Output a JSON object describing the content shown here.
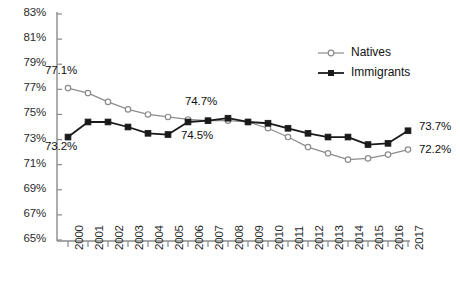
{
  "chart_data": {
    "type": "line",
    "title": "",
    "subtitle": "",
    "xlabel": "",
    "ylabel": "",
    "categories": [
      "2000",
      "2001",
      "2002",
      "2003",
      "2004",
      "2005",
      "2006",
      "2007",
      "2008",
      "2009",
      "2010",
      "2011",
      "2012",
      "2013",
      "2014",
      "2015",
      "2016",
      "2017"
    ],
    "xtick_labels": [
      "2000",
      "2001",
      "2002",
      "2003",
      "2004",
      "2005",
      "2006",
      "2007",
      "2008",
      "2009",
      "2010",
      "2011",
      "2012",
      "2013",
      "2014",
      "2015",
      "2016",
      "2017"
    ],
    "ytick_labels": [
      "83%",
      "81%",
      "79%",
      "77%",
      "75%",
      "73%",
      "71%",
      "69%",
      "67%",
      "65%"
    ],
    "ytick_values": [
      83,
      81,
      79,
      77,
      75,
      73,
      71,
      69,
      67,
      65
    ],
    "ylim": [
      65,
      83
    ],
    "xlim": [
      "2000",
      "2017"
    ],
    "grid": false,
    "legend_position": "top-right",
    "series": [
      {
        "name": "Natives",
        "color": "#8c8c8c",
        "marker": "open-circle",
        "values": [
          77.1,
          76.7,
          76.0,
          75.4,
          75.0,
          74.8,
          74.6,
          74.5,
          74.5,
          74.4,
          73.9,
          73.2,
          72.4,
          71.9,
          71.4,
          71.5,
          71.8,
          72.2
        ]
      },
      {
        "name": "Immigrants",
        "color": "#1a1a1a",
        "marker": "filled-square",
        "values": [
          73.2,
          74.4,
          74.4,
          74.0,
          73.5,
          73.4,
          74.4,
          74.5,
          74.7,
          74.4,
          74.3,
          73.9,
          73.5,
          73.2,
          73.2,
          72.6,
          72.7,
          73.7
        ]
      }
    ],
    "annotations": [
      {
        "text": "77.1%",
        "series": "Natives",
        "category": "2000",
        "value": 77.1
      },
      {
        "text": "73.2%",
        "series": "Immigrants",
        "category": "2000",
        "value": 73.2
      },
      {
        "text": "74.7%",
        "series": "Immigrants",
        "category": "2008",
        "value": 74.7
      },
      {
        "text": "74.5%",
        "series": "Natives",
        "category": "2008",
        "value": 74.5
      },
      {
        "text": "73.7%",
        "series": "Immigrants",
        "category": "2017",
        "value": 73.7
      },
      {
        "text": "72.2%",
        "series": "Natives",
        "category": "2017",
        "value": 72.2
      }
    ],
    "legend": [
      {
        "label": "Natives",
        "color": "#8c8c8c",
        "marker": "open-circle"
      },
      {
        "label": "Immigrants",
        "color": "#1a1a1a",
        "marker": "filled-square"
      }
    ]
  }
}
